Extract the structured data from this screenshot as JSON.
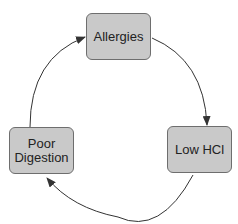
{
  "diagram": {
    "type": "cycle",
    "nodes": [
      {
        "id": "allergies",
        "label": "Allergies"
      },
      {
        "id": "low-hcl",
        "label": "Low HCl"
      },
      {
        "id": "poor-digestion",
        "label": "Poor\nDigestion"
      }
    ],
    "edges": [
      {
        "from": "allergies",
        "to": "low-hcl"
      },
      {
        "from": "low-hcl",
        "to": "poor-digestion"
      },
      {
        "from": "poor-digestion",
        "to": "allergies"
      }
    ],
    "colors": {
      "node_fill": "#c9c9c9",
      "node_border": "#6e6e6e",
      "edge": "#333333",
      "text": "#222222"
    }
  }
}
